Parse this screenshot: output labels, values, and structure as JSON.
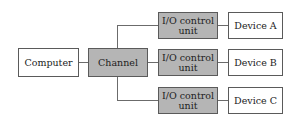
{
  "diagram": {
    "colors": {
      "box_fill_gray": "#b5b5b5",
      "box_fill_white": "#ffffff",
      "line": "#6b6b6b",
      "border": "#5a5a5a"
    },
    "computer": {
      "label": "Computer"
    },
    "channel": {
      "label": "Channel"
    },
    "io_units": [
      {
        "line1": "I/O control",
        "line2": "unit"
      },
      {
        "line1": "I/O control",
        "line2": "unit"
      },
      {
        "line1": "I/O control",
        "line2": "unit"
      }
    ],
    "devices": [
      {
        "label": "Device A"
      },
      {
        "label": "Device B"
      },
      {
        "label": "Device C"
      }
    ]
  }
}
